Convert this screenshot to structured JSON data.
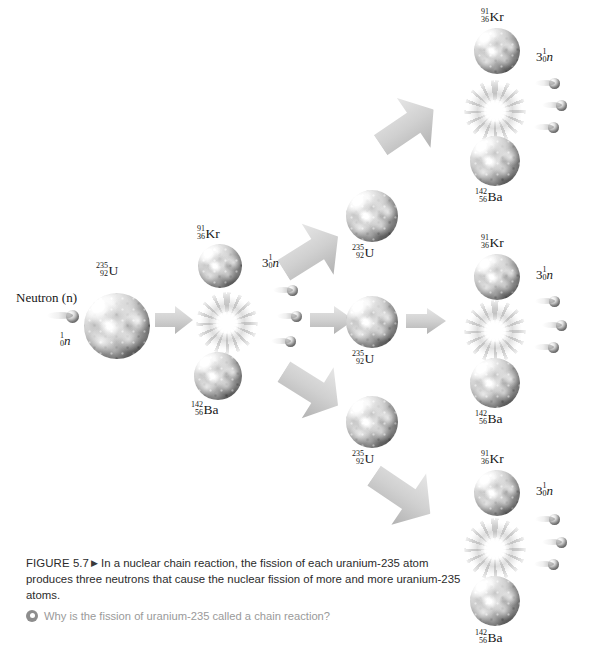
{
  "figure": {
    "caption_label": "FIGURE 5.7",
    "caption_marker": "▶",
    "caption_text": "In a nuclear chain reaction, the fission of each uranium-235 atom produces three neutrons that cause the nuclear fission of more and more uranium-235 atoms.",
    "question": "Why is the fission of uranium-235 called a chain reaction?",
    "question_icon": "target-dot-icon"
  },
  "labels": {
    "neutron_word": "Neutron (n)",
    "neutron_single": {
      "mass": "1",
      "atomic": "0",
      "symbol": "n"
    },
    "neutron_triple": {
      "count": "3",
      "mass": "1",
      "atomic": "0",
      "symbol": "n"
    },
    "uranium": {
      "mass": "235",
      "atomic": "92",
      "symbol": "U"
    },
    "krypton": {
      "mass": "91",
      "atomic": "36",
      "symbol": "Kr"
    },
    "barium": {
      "mass": "142",
      "atomic": "56",
      "symbol": "Ba"
    }
  },
  "reaction": {
    "generations": 3,
    "neutrons_per_fission": 3,
    "fissile_isotope": "uranium-235",
    "products": [
      "krypton-91",
      "barium-142"
    ],
    "stages": [
      {
        "generation": 1,
        "name": "initial-fission",
        "incoming_neutrons": 1,
        "target": "uranium-235",
        "emitted_neutrons": 3,
        "products": [
          "krypton-91",
          "barium-142"
        ]
      },
      {
        "generation": 2,
        "name": "second-generation",
        "targets": 3,
        "branches": [
          "upper",
          "middle",
          "lower"
        ]
      },
      {
        "generation": 3,
        "name": "third-generation",
        "fissions": 3,
        "emitted_neutrons_each": 3,
        "products_each": [
          "krypton-91",
          "barium-142"
        ]
      }
    ]
  },
  "colors": {
    "background": "#ffffff",
    "arrow": "#d5d5d5",
    "arrow_shadow": "#b9b9b9",
    "text": "#171717",
    "caption_text": "#2b2b2b",
    "question_text": "#9a9a9a",
    "question_icon": "#8d8d8d",
    "nucleus_light": "#f0f0f0",
    "nucleus_dark": "#6e6e6e",
    "burst_center": "#ffffff"
  }
}
